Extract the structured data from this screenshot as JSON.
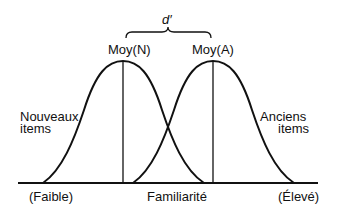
{
  "diagram": {
    "type": "signal-detection-distributions",
    "top_label": "d′",
    "means": [
      {
        "label": "Moy(N)"
      },
      {
        "label": "Moy(A)"
      }
    ],
    "distributions": [
      {
        "label_line1": "Nouveaux",
        "label_line2": "items"
      },
      {
        "label_line1": "Anciens",
        "label_line2": "items"
      }
    ],
    "axis": {
      "label": "Familiarité",
      "low": "(Faible)",
      "high": "(Élevé)"
    },
    "colors": {
      "stroke": "#111111",
      "background": "#ffffff"
    }
  }
}
